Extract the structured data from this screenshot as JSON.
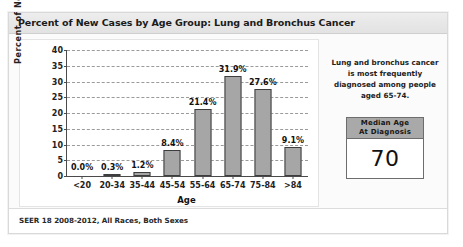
{
  "header": {
    "title": "Percent of New Cases by Age Group: Lung and Bronchus Cancer"
  },
  "footer": {
    "source": "SEER 18 2008-2012, All Races, Both Sexes"
  },
  "side_panel": {
    "note": "Lung and bronchus cancer is most frequently diagnosed among people aged 65-74.",
    "median_box": {
      "header_line1": "Median Age",
      "header_line2": "At Diagnosis",
      "value": "70"
    }
  },
  "chart_data": {
    "type": "bar",
    "title": "Percent of New Cases by Age Group: Lung and Bronchus Cancer",
    "xlabel": "Age",
    "ylabel": "Percent of New Cases",
    "categories": [
      "<20",
      "20-34",
      "35-44",
      "45-54",
      "55-64",
      "65-74",
      "75-84",
      ">84"
    ],
    "values": [
      0.0,
      0.3,
      1.2,
      8.4,
      21.4,
      31.9,
      27.6,
      9.1
    ],
    "data_labels": [
      "0.0%",
      "0.3%",
      "1.2%",
      "8.4%",
      "21.4%",
      "31.9%",
      "27.6%",
      "9.1%"
    ],
    "ylim": [
      0,
      40
    ],
    "yticks": [
      0,
      5,
      10,
      15,
      20,
      25,
      30,
      35,
      40
    ],
    "ytick_labels": [
      "0",
      "5",
      "10",
      "15",
      "20",
      "25",
      "30",
      "35",
      "40"
    ],
    "grid": true,
    "legend": false,
    "bar_color": "#a6a6a6",
    "bar_border_color": "#3d3d3d"
  }
}
